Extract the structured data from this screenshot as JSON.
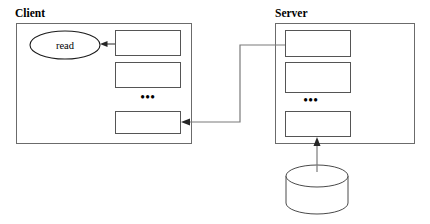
{
  "diagram": {
    "colors": {
      "background": "#ffffff",
      "outline": "#6b6b6b",
      "box_stroke": "#555555",
      "connector": "#7a7a7a",
      "arrow": "#262626",
      "text": "#000000"
    },
    "panels": [
      {
        "id": "client",
        "label": "Client",
        "boxes": [
          {
            "label": ""
          },
          {
            "label": ""
          },
          {
            "label": ""
          }
        ],
        "ellipsis": "•••",
        "operation": {
          "name": "read-node",
          "label": "read"
        }
      },
      {
        "id": "server",
        "label": "Server",
        "boxes": [
          {
            "label": ""
          },
          {
            "label": ""
          },
          {
            "label": ""
          }
        ],
        "ellipsis": "•••",
        "storage": {
          "name": "database-cylinder",
          "label": ""
        }
      }
    ],
    "connectors": [
      {
        "name": "server-to-client-connector",
        "from": "server-box-1",
        "to": "client-box-3",
        "label": ""
      },
      {
        "name": "database-to-server-connector",
        "from": "database-cylinder",
        "to": "server-box-3",
        "label": ""
      },
      {
        "name": "client-box-to-read-connector",
        "from": "client-box-1",
        "to": "read-node",
        "label": ""
      }
    ]
  }
}
